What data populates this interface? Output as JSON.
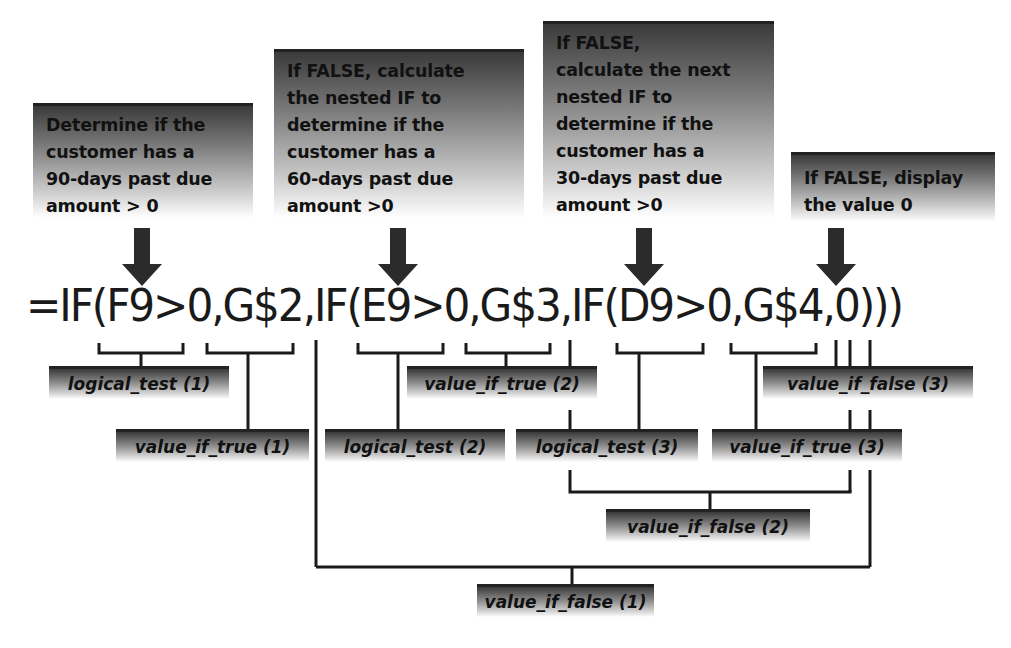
{
  "callouts": {
    "c1": "Determine if the\ncustomer has a\n90-days past due\namount > 0",
    "c2": "If FALSE, calculate\nthe nested IF to\ndetermine if the\ncustomer has a\n60-days past due\namount >0",
    "c3": "If FALSE,\ncalculate the next\nnested IF to\ndetermine if the\ncustomer has a\n30-days past due\namount >0",
    "c4": "If FALSE, display\nthe value 0"
  },
  "formula": "=IF(F9>0,G$2,IF(E9>0,G$3,IF(D9>0,G$4,0)))",
  "labels": {
    "logical_test_1": "logical_test (1)",
    "value_if_true_1": "value_if_true (1)",
    "logical_test_2": "logical_test (2)",
    "value_if_true_2": "value_if_true (2)",
    "logical_test_3": "logical_test (3)",
    "value_if_true_3": "value_if_true (3)",
    "value_if_false_3": "value_if_false (3)",
    "value_if_false_2": "value_if_false (2)",
    "value_if_false_1": "value_if_false (1)"
  },
  "colors": {
    "box_dark": "#3a3a3a",
    "line": "#1a1a1a",
    "text": "#111111"
  }
}
